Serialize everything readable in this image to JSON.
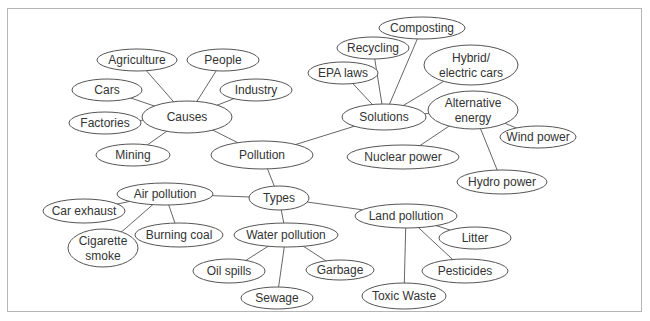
{
  "diagram": {
    "type": "concept-map",
    "center": "Pollution",
    "nodes": [
      {
        "id": "pollution",
        "label": [
          "Pollution"
        ],
        "cx": 262,
        "cy": 155,
        "rx": 51,
        "ry": 14
      },
      {
        "id": "causes",
        "label": [
          "Causes"
        ],
        "cx": 187,
        "cy": 117,
        "rx": 45,
        "ry": 16
      },
      {
        "id": "agriculture",
        "label": [
          "Agriculture"
        ],
        "cx": 137,
        "cy": 60,
        "rx": 40,
        "ry": 11
      },
      {
        "id": "people",
        "label": [
          "People"
        ],
        "cx": 223,
        "cy": 60,
        "rx": 36,
        "ry": 11
      },
      {
        "id": "cars",
        "label": [
          "Cars"
        ],
        "cx": 107,
        "cy": 90,
        "rx": 35,
        "ry": 11
      },
      {
        "id": "industry",
        "label": [
          "Industry"
        ],
        "cx": 256,
        "cy": 90,
        "rx": 36,
        "ry": 11
      },
      {
        "id": "factories",
        "label": [
          "Factories"
        ],
        "cx": 105,
        "cy": 123,
        "rx": 36,
        "ry": 11
      },
      {
        "id": "mining",
        "label": [
          "Mining"
        ],
        "cx": 133,
        "cy": 155,
        "rx": 37,
        "ry": 11
      },
      {
        "id": "solutions",
        "label": [
          "Solutions"
        ],
        "cx": 384,
        "cy": 117,
        "rx": 42,
        "ry": 13
      },
      {
        "id": "epa-laws",
        "label": [
          "EPA laws"
        ],
        "cx": 343,
        "cy": 73,
        "rx": 35,
        "ry": 11
      },
      {
        "id": "recycling",
        "label": [
          "Recycling"
        ],
        "cx": 373,
        "cy": 48,
        "rx": 36,
        "ry": 11
      },
      {
        "id": "composting",
        "label": [
          "Composting"
        ],
        "cx": 422,
        "cy": 28,
        "rx": 43,
        "ry": 11
      },
      {
        "id": "hybrid-cars",
        "label": [
          "Hybrid/",
          "electric cars"
        ],
        "cx": 471,
        "cy": 65,
        "rx": 47,
        "ry": 20
      },
      {
        "id": "alternative-energy",
        "label": [
          "Alternative",
          "energy"
        ],
        "cx": 473,
        "cy": 110,
        "rx": 45,
        "ry": 19
      },
      {
        "id": "wind-power",
        "label": [
          "Wind power"
        ],
        "cx": 538,
        "cy": 137,
        "rx": 38,
        "ry": 11
      },
      {
        "id": "nuclear-power",
        "label": [
          "Nuclear power"
        ],
        "cx": 403,
        "cy": 157,
        "rx": 56,
        "ry": 12
      },
      {
        "id": "hydro-power",
        "label": [
          "Hydro power"
        ],
        "cx": 502,
        "cy": 182,
        "rx": 45,
        "ry": 12
      },
      {
        "id": "types",
        "label": [
          "Types"
        ],
        "cx": 279,
        "cy": 198,
        "rx": 30,
        "ry": 12
      },
      {
        "id": "air-pollution",
        "label": [
          "Air pollution"
        ],
        "cx": 165,
        "cy": 194,
        "rx": 48,
        "ry": 11
      },
      {
        "id": "car-exhaust",
        "label": [
          "Car exhaust"
        ],
        "cx": 84,
        "cy": 211,
        "rx": 41,
        "ry": 12
      },
      {
        "id": "burning-coal",
        "label": [
          "Burning coal"
        ],
        "cx": 179,
        "cy": 235,
        "rx": 44,
        "ry": 12
      },
      {
        "id": "cigarette-smoke",
        "label": [
          "Cigarette",
          "smoke"
        ],
        "cx": 103,
        "cy": 248,
        "rx": 35,
        "ry": 19
      },
      {
        "id": "water-pollution",
        "label": [
          "Water pollution"
        ],
        "cx": 286,
        "cy": 235,
        "rx": 52,
        "ry": 12
      },
      {
        "id": "oil-spills",
        "label": [
          "Oil spills"
        ],
        "cx": 229,
        "cy": 271,
        "rx": 36,
        "ry": 12
      },
      {
        "id": "garbage",
        "label": [
          "Garbage"
        ],
        "cx": 340,
        "cy": 270,
        "rx": 34,
        "ry": 10
      },
      {
        "id": "sewage",
        "label": [
          "Sewage"
        ],
        "cx": 277,
        "cy": 298,
        "rx": 36,
        "ry": 11
      },
      {
        "id": "land-pollution",
        "label": [
          "Land pollution"
        ],
        "cx": 406,
        "cy": 216,
        "rx": 51,
        "ry": 12
      },
      {
        "id": "litter",
        "label": [
          "Litter"
        ],
        "cx": 475,
        "cy": 238,
        "rx": 36,
        "ry": 11
      },
      {
        "id": "pesticides",
        "label": [
          "Pesticides"
        ],
        "cx": 465,
        "cy": 271,
        "rx": 43,
        "ry": 12
      },
      {
        "id": "toxic-waste",
        "label": [
          "Toxic Waste"
        ],
        "cx": 404,
        "cy": 296,
        "rx": 42,
        "ry": 13
      }
    ],
    "edges": [
      [
        "pollution",
        "causes"
      ],
      [
        "pollution",
        "solutions"
      ],
      [
        "pollution",
        "types"
      ],
      [
        "causes",
        "agriculture"
      ],
      [
        "causes",
        "people"
      ],
      [
        "causes",
        "cars"
      ],
      [
        "causes",
        "industry"
      ],
      [
        "causes",
        "factories"
      ],
      [
        "causes",
        "mining"
      ],
      [
        "solutions",
        "epa-laws"
      ],
      [
        "solutions",
        "recycling"
      ],
      [
        "solutions",
        "composting"
      ],
      [
        "solutions",
        "hybrid-cars"
      ],
      [
        "solutions",
        "alternative-energy"
      ],
      [
        "alternative-energy",
        "wind-power"
      ],
      [
        "alternative-energy",
        "nuclear-power"
      ],
      [
        "alternative-energy",
        "hydro-power"
      ],
      [
        "types",
        "air-pollution"
      ],
      [
        "types",
        "water-pollution"
      ],
      [
        "types",
        "land-pollution"
      ],
      [
        "air-pollution",
        "car-exhaust"
      ],
      [
        "air-pollution",
        "burning-coal"
      ],
      [
        "air-pollution",
        "cigarette-smoke"
      ],
      [
        "water-pollution",
        "oil-spills"
      ],
      [
        "water-pollution",
        "garbage"
      ],
      [
        "water-pollution",
        "sewage"
      ],
      [
        "land-pollution",
        "litter"
      ],
      [
        "land-pollution",
        "pesticides"
      ],
      [
        "land-pollution",
        "toxic-waste"
      ]
    ]
  }
}
